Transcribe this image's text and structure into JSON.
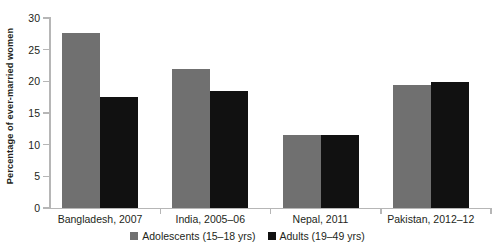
{
  "chart_data": {
    "type": "bar",
    "title": "",
    "subtitle": "",
    "xlabel": "",
    "ylabel": "Percentage of ever-married women",
    "ylim": [
      0,
      30
    ],
    "yticks": [
      0,
      5,
      10,
      15,
      20,
      25,
      30
    ],
    "ytick_labels": [
      "0",
      "5",
      "10",
      "15",
      "20",
      "25",
      "30"
    ],
    "grid": false,
    "legend_position": "bottom-center",
    "categories": [
      "Bangladesh, 2007",
      "India, 2005–06",
      "Nepal, 2011",
      "Pakistan, 2012–12"
    ],
    "series": [
      {
        "name": "Adolescents (15–18 yrs)",
        "color": "#707070",
        "values": [
          27.6,
          21.9,
          11.6,
          19.4
        ]
      },
      {
        "name": "Adults (19–49 yrs)",
        "color": "#111111",
        "values": [
          17.5,
          18.4,
          11.6,
          19.9
        ]
      }
    ],
    "annotations": []
  },
  "legend": {
    "items": [
      {
        "label": "Adolescents (15–18 yrs)",
        "swatch": "adolescents-swatch"
      },
      {
        "label": "Adults (19–49 yrs)",
        "swatch": "adults-swatch"
      }
    ]
  },
  "axis": {
    "line_color": "#b6b6b6",
    "text_color": "#231f20"
  }
}
